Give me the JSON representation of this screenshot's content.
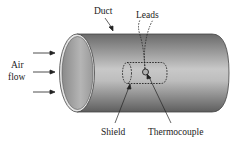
{
  "diagram": {
    "labels": {
      "duct": "Duct",
      "leads": "Leads",
      "air_line1": "Air",
      "air_line2": "flow",
      "shield": "Shield",
      "thermocouple": "Thermocouple"
    },
    "colors": {
      "duct_dark": "#6e6e6e",
      "duct_light": "#d8d8d8",
      "outline": "#333333",
      "background": "#ffffff"
    },
    "flow_arrows": 3
  }
}
